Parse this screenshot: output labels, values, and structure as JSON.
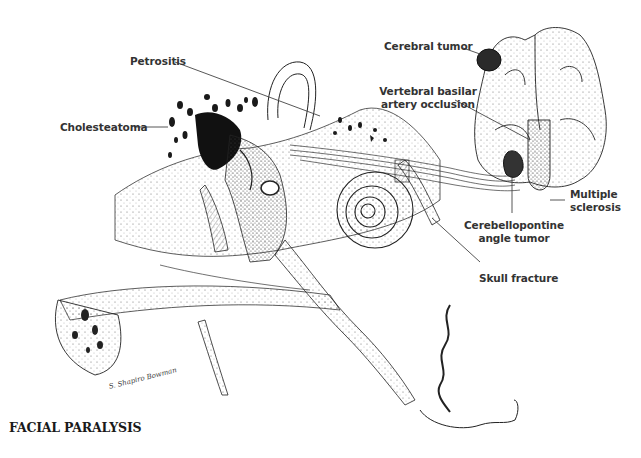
{
  "figure": {
    "title": "FACIAL PARALYSIS",
    "signature": "S. Shapiro Bowman",
    "labels": [
      {
        "id": "petrositis",
        "text": "Petrositis"
      },
      {
        "id": "cholesteatoma",
        "text": "Cholesteatoma"
      },
      {
        "id": "cerebral-tumor",
        "text": "Cerebral tumor"
      },
      {
        "id": "vertebral-basilar",
        "text": "Vertebral basilar\nartery occlusion",
        "line1": "Vertebral basilar",
        "line2": "artery occlusion"
      },
      {
        "id": "multiple-sclerosis",
        "text": "Multiple\nsclerosis",
        "line1": "Multiple",
        "line2": "sclerosis"
      },
      {
        "id": "cerebellopontine",
        "text": "Cerebellopontine\nangle tumor",
        "line1": "Cerebellopontine",
        "line2": "angle tumor"
      },
      {
        "id": "skull-fracture",
        "text": "Skull fracture"
      }
    ],
    "colors": {
      "ink": "#1a1a1a",
      "label": "#333333",
      "background": "#ffffff"
    }
  }
}
